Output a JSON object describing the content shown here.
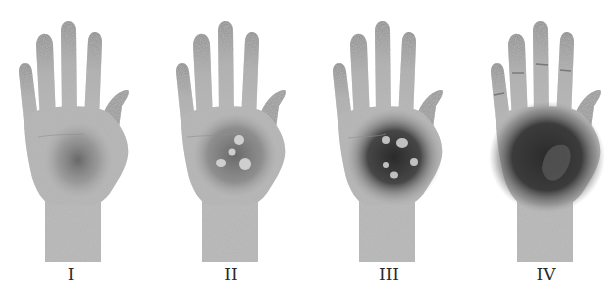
{
  "figure": {
    "panels": [
      {
        "id": "stage-1",
        "label": "I",
        "center_x": 71
      },
      {
        "id": "stage-2",
        "label": "II",
        "center_x": 231
      },
      {
        "id": "stage-3",
        "label": "III",
        "center_x": 389
      },
      {
        "id": "stage-4",
        "label": "IV",
        "center_x": 546
      }
    ]
  },
  "colors": {
    "background": "#ffffff",
    "skin": "#b9b9b9",
    "finger_top": "#8d8d8d",
    "lesion_dark": "#2e2e2e",
    "label": "#2a2a2a"
  }
}
